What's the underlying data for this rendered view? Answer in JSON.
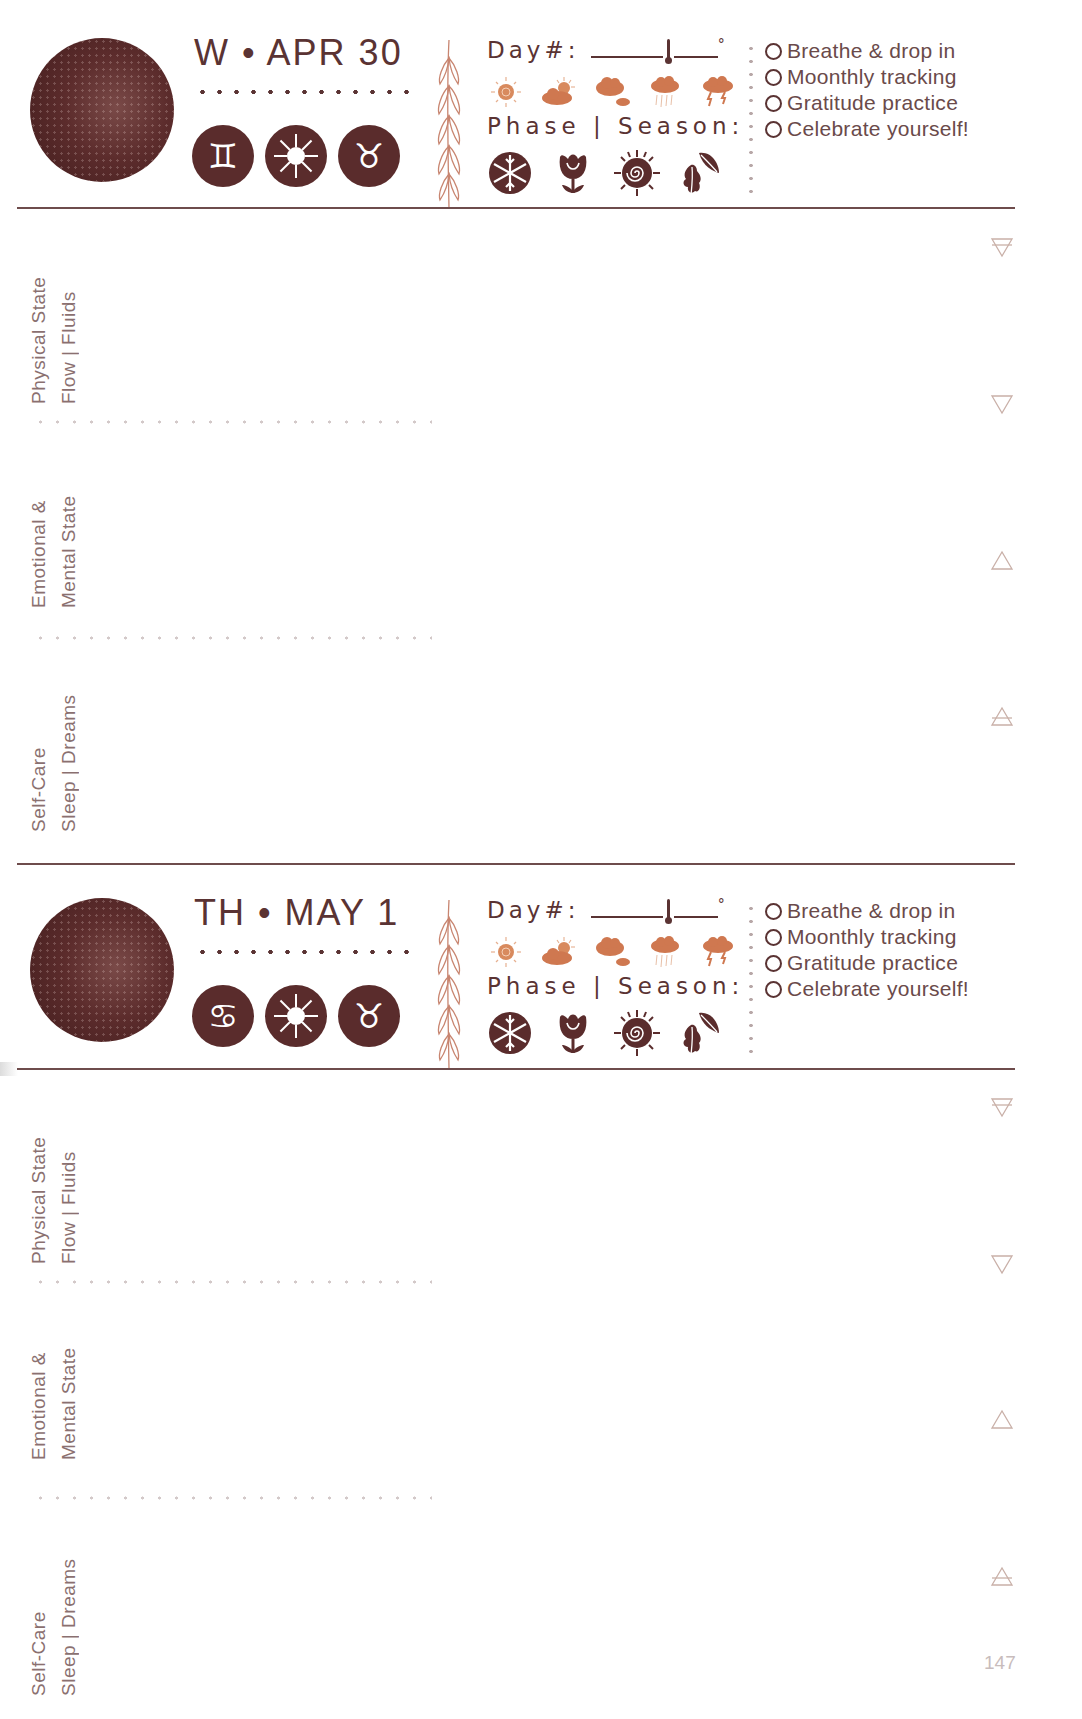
{
  "page": {
    "page_number": "147"
  },
  "colors": {
    "primary": "#5a2c2c",
    "accent_orange": "#d0794f",
    "label_gray": "#8a7070",
    "rule": "#6e4c4c"
  },
  "checklist_template": [
    "Breathe & drop in",
    "Moonthly tracking",
    "Gratitude practice",
    "Celebrate yourself!"
  ],
  "days": [
    {
      "date_label": "W • APR 30",
      "moon_icon": "waning-moon-icon",
      "signs": [
        {
          "icon": "gemini-icon",
          "glyph": "♊"
        },
        {
          "icon": "sun-icon",
          "glyph": ""
        },
        {
          "icon": "taurus-icon",
          "glyph": "♉"
        }
      ],
      "day_number_label": "Day#:",
      "temperature_unit": "°",
      "weather_icons": [
        "sunny-icon",
        "partly-cloudy-icon",
        "cloudy-icon",
        "rain-icon",
        "storm-icon"
      ],
      "phase_season_label": "Phase | Season:",
      "season_icons": [
        "winter-snowflake-icon",
        "spring-tulip-icon",
        "summer-sun-spiral-icon",
        "autumn-leaves-icon"
      ],
      "checklist": [
        "Breathe & drop in",
        "Moonthly tracking",
        "Gratitude practice",
        "Celebrate yourself!"
      ],
      "sections": [
        {
          "line1": "Physical State",
          "line2": "Flow | Fluids",
          "element_icon": "earth-element-icon"
        },
        {
          "line1": "",
          "line2": "",
          "element_icon": "water-element-icon"
        },
        {
          "line1": "Emotional &",
          "line2": "Mental State",
          "element_icon": "fire-element-icon"
        },
        {
          "line1": "Self-Care",
          "line2": "Sleep | Dreams",
          "element_icon": "air-element-icon"
        }
      ]
    },
    {
      "date_label": "TH • MAY 1",
      "moon_icon": "waning-moon-icon",
      "signs": [
        {
          "icon": "cancer-icon",
          "glyph": "♋"
        },
        {
          "icon": "sun-icon",
          "glyph": ""
        },
        {
          "icon": "taurus-icon",
          "glyph": "♉"
        }
      ],
      "day_number_label": "Day#:",
      "temperature_unit": "°",
      "weather_icons": [
        "sunny-icon",
        "partly-cloudy-icon",
        "cloudy-icon",
        "rain-icon",
        "storm-icon"
      ],
      "phase_season_label": "Phase | Season:",
      "season_icons": [
        "winter-snowflake-icon",
        "spring-tulip-icon",
        "summer-sun-spiral-icon",
        "autumn-leaves-icon"
      ],
      "checklist": [
        "Breathe & drop in",
        "Moonthly tracking",
        "Gratitude practice",
        "Celebrate yourself!"
      ],
      "sections": [
        {
          "line1": "Physical State",
          "line2": "Flow | Fluids",
          "element_icon": "earth-element-icon"
        },
        {
          "line1": "",
          "line2": "",
          "element_icon": "water-element-icon"
        },
        {
          "line1": "Emotional &",
          "line2": "Mental State",
          "element_icon": "fire-element-icon"
        },
        {
          "line1": "Self-Care",
          "line2": "Sleep | Dreams",
          "element_icon": "air-element-icon"
        }
      ]
    }
  ]
}
